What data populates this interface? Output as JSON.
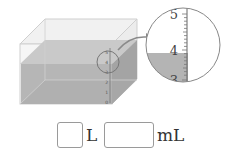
{
  "figure": {
    "container": "rectangular water tank with scale",
    "box_scale_labels": [
      "0",
      "1",
      "2",
      "3",
      "4",
      "5"
    ],
    "magnifier_labels": [
      "5",
      "4",
      "3"
    ],
    "water_level_reading": "between 3 and 4, just below 4",
    "colors": {
      "water": "#b4b4b4",
      "water_dark": "#9e9e9e",
      "glass": "#eeeeee",
      "edge": "#c8c8c8",
      "arrow": "#8a8a8a"
    }
  },
  "answer": {
    "liters_value": "",
    "liters_unit": "L",
    "milliliters_value": "",
    "milliliters_unit": "mL"
  }
}
